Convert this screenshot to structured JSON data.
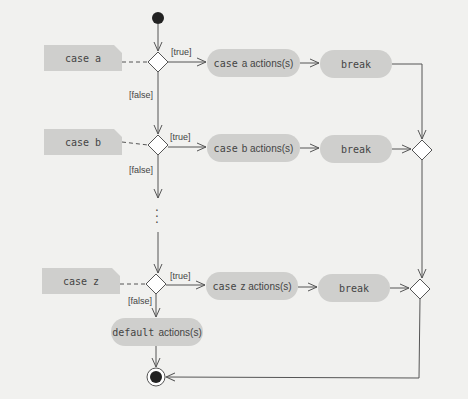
{
  "diagram": {
    "type": "UML activity diagram",
    "colors": {
      "background": "#f1f1ef",
      "node_fill": "#cfcfcd",
      "line": "#555555",
      "text": "#444444"
    },
    "cases": [
      {
        "note": "case a",
        "guard_true": "[true]",
        "guard_false": "[false]",
        "action_kw": "case",
        "action_rest": "a actions(s)",
        "break": "break"
      },
      {
        "note": "case b",
        "guard_true": "[true]",
        "guard_false": "[false]",
        "action_kw": "case",
        "action_rest": "b actions(s)",
        "break": "break"
      },
      {
        "note": "case z",
        "guard_true": "[true]",
        "guard_false": "[false]",
        "action_kw": "case",
        "action_rest": "z actions(s)",
        "break": "break"
      }
    ],
    "ellipsis": "⋮",
    "default": {
      "kw": "default",
      "rest": "actions(s)"
    }
  }
}
